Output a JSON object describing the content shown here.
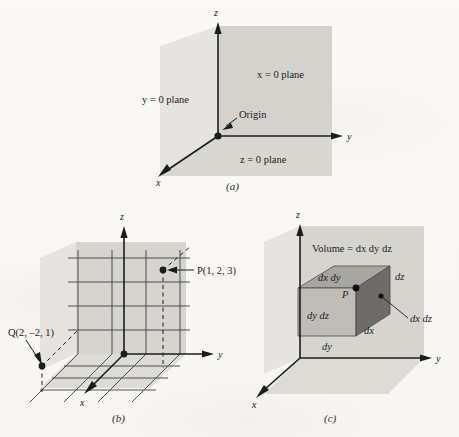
{
  "figure": {
    "panels": [
      {
        "id": "a",
        "caption": "(a)",
        "axes": {
          "x": "x",
          "y": "y",
          "z": "z"
        },
        "labels": {
          "x_plane": "x = 0 plane",
          "y_plane": "y = 0 plane",
          "z_plane": "z = 0 plane",
          "origin": "Origin"
        }
      },
      {
        "id": "b",
        "caption": "(b)",
        "axes": {
          "x": "x",
          "y": "y",
          "z": "z"
        },
        "points": [
          {
            "name": "P",
            "label": "P(1, 2, 3)",
            "coords": [
              1,
              2,
              3
            ]
          },
          {
            "name": "Q",
            "label": "Q(2, –2, 1)",
            "coords": [
              2,
              -2,
              1
            ]
          }
        ]
      },
      {
        "id": "c",
        "caption": "(c)",
        "axes": {
          "x": "x",
          "y": "y",
          "z": "z"
        },
        "volume_label": "Volume = dx dy dz",
        "point": "P",
        "faces": {
          "top": "dx dy",
          "front": "dy dz",
          "right": "dx dz"
        },
        "edges": {
          "depth": "dy",
          "height": "dz",
          "width": "dx"
        }
      }
    ]
  },
  "colors": {
    "ink": "#1c1c1c",
    "page": "#fbfaf8",
    "plane_light": "#e3e1dd",
    "plane_mid": "#d2d0cb",
    "plane_dark": "#c4c2bd",
    "box_top": "#a8a6a1",
    "box_front": "#bdbbb6",
    "box_right": "#6e6c68",
    "grid_line": "#3a3a3a"
  }
}
